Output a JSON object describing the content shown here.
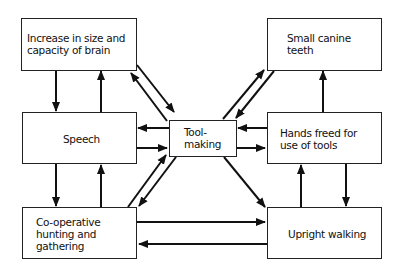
{
  "diagram": {
    "nodes": [
      {
        "id": "brain",
        "label": "Increase in size and\ncapacity of brain"
      },
      {
        "id": "teeth",
        "label": "Small canine\nteeth"
      },
      {
        "id": "speech",
        "label": "Speech"
      },
      {
        "id": "toolmaking",
        "label": "Tool-\nmaking"
      },
      {
        "id": "hands",
        "label": "Hands freed for\nuse of tools"
      },
      {
        "id": "hunting",
        "label": "Co-operative\nhunting and\ngathering"
      },
      {
        "id": "walking",
        "label": "Upright walking"
      }
    ],
    "edges": [
      {
        "from": "brain",
        "to": "speech"
      },
      {
        "from": "speech",
        "to": "brain"
      },
      {
        "from": "brain",
        "to": "toolmaking"
      },
      {
        "from": "toolmaking",
        "to": "brain"
      },
      {
        "from": "toolmaking",
        "to": "teeth"
      },
      {
        "from": "teeth",
        "to": "toolmaking"
      },
      {
        "from": "toolmaking",
        "to": "speech"
      },
      {
        "from": "speech",
        "to": "toolmaking"
      },
      {
        "from": "hands",
        "to": "toolmaking"
      },
      {
        "from": "toolmaking",
        "to": "hands"
      },
      {
        "from": "hands",
        "to": "teeth"
      },
      {
        "from": "speech",
        "to": "hunting"
      },
      {
        "from": "hunting",
        "to": "speech"
      },
      {
        "from": "hunting",
        "to": "toolmaking"
      },
      {
        "from": "toolmaking",
        "to": "hunting"
      },
      {
        "from": "toolmaking",
        "to": "walking"
      },
      {
        "from": "walking",
        "to": "hands"
      },
      {
        "from": "hands",
        "to": "walking"
      },
      {
        "from": "hunting",
        "to": "walking"
      },
      {
        "from": "walking",
        "to": "hunting"
      }
    ]
  }
}
